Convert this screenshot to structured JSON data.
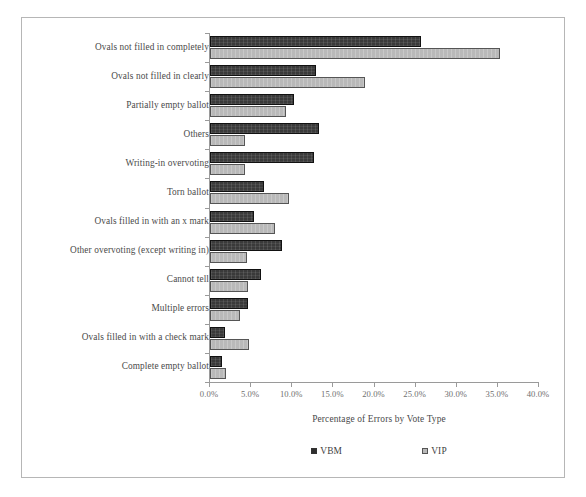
{
  "clipped_top_text": "",
  "chart_data": {
    "type": "bar",
    "orientation": "horizontal",
    "title": "",
    "xlabel": "Percentage of Errors by Vote Type",
    "ylabel": "",
    "xlim": [
      0,
      40
    ],
    "xtick_labels": [
      "0.0%",
      "5.0%",
      "10.0%",
      "15.0%",
      "20.0%",
      "25.0%",
      "30.0%",
      "35.0%",
      "40.0%"
    ],
    "xtick_values": [
      0,
      5,
      10,
      15,
      20,
      25,
      30,
      35,
      40
    ],
    "grid": false,
    "legend_position": "bottom",
    "categories": [
      "Ovals not filled in completely",
      "Ovals not filled in clearly",
      "Partially empty ballot",
      "Others",
      "Writing-in overvoting",
      "Torn ballot",
      "Ovals filled in with an x mark",
      "Other overvoting (except writing in)",
      "Cannot tell",
      "Multiple errors",
      "Ovals filled in with a check mark",
      "Complete empty ballot"
    ],
    "series": [
      {
        "name": "VBM",
        "color": "#3a3a3a",
        "values": [
          25.6,
          12.9,
          10.2,
          13.2,
          12.7,
          6.6,
          5.4,
          8.8,
          6.2,
          4.6,
          1.8,
          1.4
        ]
      },
      {
        "name": "VIP",
        "color": "#b9b9b9",
        "values": [
          35.2,
          18.9,
          9.3,
          4.3,
          4.3,
          9.6,
          7.9,
          4.5,
          4.6,
          3.6,
          4.7,
          2.0
        ]
      }
    ]
  },
  "legend": {
    "entries": [
      {
        "label": "VBM",
        "swatch": "dark-square-swatch"
      },
      {
        "label": "VIP",
        "swatch": "light-square-swatch"
      }
    ]
  }
}
